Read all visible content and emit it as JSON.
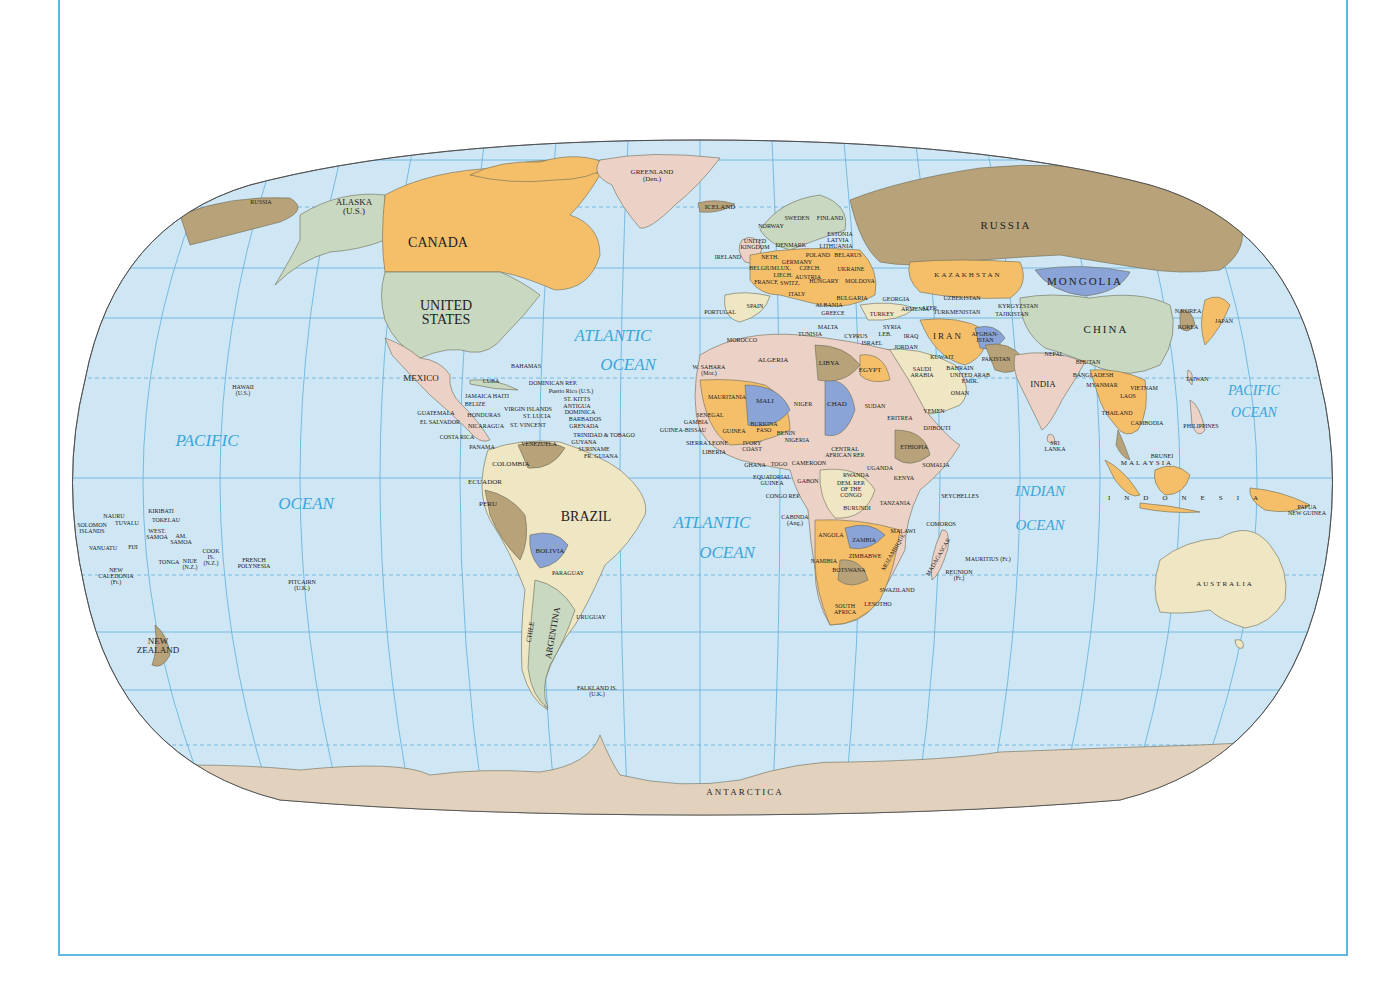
{
  "map": {
    "projection": "Robinson",
    "colors": {
      "ocean": "#cfe6f5",
      "graticule": "#5fb0dc",
      "frame": "#5fb8e3",
      "orange": "#f5bf6a",
      "tan": "#b7a27a",
      "green": "#c9d8c0",
      "pink": "#ecd2c6",
      "blue": "#8aa4d8",
      "cream": "#efe6c4",
      "antarctica": "#e2d2bd",
      "label": "#222222",
      "ocean_label": "#3aa6d8"
    }
  },
  "oceans": [
    {
      "id": "pacific-west-1",
      "text": "PACIFIC",
      "x": 207,
      "y": 441
    },
    {
      "id": "pacific-west-2",
      "text": "OCEAN",
      "x": 306,
      "y": 504
    },
    {
      "id": "atlantic-north-1",
      "text": "ATLANTIC",
      "x": 613,
      "y": 336
    },
    {
      "id": "atlantic-north-2",
      "text": "OCEAN",
      "x": 628,
      "y": 365
    },
    {
      "id": "atlantic-south-1",
      "text": "ATLANTIC",
      "x": 712,
      "y": 523
    },
    {
      "id": "atlantic-south-2",
      "text": "OCEAN",
      "x": 727,
      "y": 553
    },
    {
      "id": "indian-1",
      "text": "INDIAN",
      "x": 1040,
      "y": 491
    },
    {
      "id": "indian-2",
      "text": "OCEAN",
      "x": 1040,
      "y": 525
    },
    {
      "id": "pacific-east-1",
      "text": "PACIFIC",
      "x": 1254,
      "y": 391
    },
    {
      "id": "pacific-east-2",
      "text": "OCEAN",
      "x": 1254,
      "y": 413
    }
  ],
  "countries": [
    {
      "text": "RUSSIA",
      "x": 261,
      "y": 202,
      "size": "xs"
    },
    {
      "text": "ALASKA\n(U.S.)",
      "x": 354,
      "y": 207,
      "size": "m"
    },
    {
      "text": "CANADA",
      "x": 438,
      "y": 243,
      "size": "xl"
    },
    {
      "text": "UNITED\nSTATES",
      "x": 446,
      "y": 313,
      "size": "xl"
    },
    {
      "text": "GREENLAND\n(Den.)",
      "x": 652,
      "y": 176,
      "size": "s"
    },
    {
      "text": "ICELAND",
      "x": 720,
      "y": 207,
      "size": "s"
    },
    {
      "text": "MEXICO",
      "x": 421,
      "y": 378,
      "size": "m"
    },
    {
      "text": "BAHAMAS",
      "x": 526,
      "y": 366,
      "size": "xs"
    },
    {
      "text": "CUBA",
      "x": 491,
      "y": 381,
      "size": "xs"
    },
    {
      "text": "DOMINICAN REP.",
      "x": 553,
      "y": 383,
      "size": "xs"
    },
    {
      "text": "Puerto Rico (U.S.)",
      "x": 571,
      "y": 391,
      "size": "xs"
    },
    {
      "text": "JAMAICA HAITI",
      "x": 487,
      "y": 396,
      "size": "xs"
    },
    {
      "text": "ST. KITTS",
      "x": 577,
      "y": 399,
      "size": "xs"
    },
    {
      "text": "BELIZE",
      "x": 475,
      "y": 404,
      "size": "xs"
    },
    {
      "text": "ANTIGUA",
      "x": 577,
      "y": 406,
      "size": "xs"
    },
    {
      "text": "VIRGIN ISLANDS",
      "x": 528,
      "y": 409,
      "size": "xs"
    },
    {
      "text": "DOMINICA",
      "x": 580,
      "y": 412,
      "size": "xs"
    },
    {
      "text": "GUATEMALA",
      "x": 436,
      "y": 413,
      "size": "xs"
    },
    {
      "text": "HONDURAS",
      "x": 484,
      "y": 415,
      "size": "xs"
    },
    {
      "text": "ST. LUCIA",
      "x": 537,
      "y": 416,
      "size": "xs"
    },
    {
      "text": "BARBADOS",
      "x": 585,
      "y": 419,
      "size": "xs"
    },
    {
      "text": "EL SALVADOR",
      "x": 440,
      "y": 422,
      "size": "xs"
    },
    {
      "text": "NICARAGUA",
      "x": 486,
      "y": 426,
      "size": "xs"
    },
    {
      "text": "ST. VINCENT",
      "x": 528,
      "y": 425,
      "size": "xs"
    },
    {
      "text": "GRENADA",
      "x": 584,
      "y": 426,
      "size": "xs"
    },
    {
      "text": "COSTA RICA",
      "x": 457,
      "y": 437,
      "size": "xs"
    },
    {
      "text": "TRINIDAD & TOBAGO",
      "x": 604,
      "y": 435,
      "size": "xs"
    },
    {
      "text": "GUYANA",
      "x": 584,
      "y": 442,
      "size": "xs"
    },
    {
      "text": "VENEZUELA",
      "x": 539,
      "y": 444,
      "size": "xs"
    },
    {
      "text": "PANAMA",
      "x": 482,
      "y": 447,
      "size": "xs"
    },
    {
      "text": "SURINAME",
      "x": 594,
      "y": 449,
      "size": "xs"
    },
    {
      "text": "FR. GUIANA",
      "x": 601,
      "y": 456,
      "size": "xs"
    },
    {
      "text": "COLOMBIA",
      "x": 511,
      "y": 464,
      "size": "s"
    },
    {
      "text": "ECUADOR",
      "x": 485,
      "y": 482,
      "size": "s"
    },
    {
      "text": "PERU",
      "x": 488,
      "y": 504,
      "size": "s"
    },
    {
      "text": "BRAZIL",
      "x": 586,
      "y": 517,
      "size": "xl"
    },
    {
      "text": "BOLIVIA",
      "x": 550,
      "y": 551,
      "size": "s"
    },
    {
      "text": "PARAGUAY",
      "x": 568,
      "y": 573,
      "size": "xs"
    },
    {
      "text": "CHILE",
      "x": 531,
      "y": 632,
      "size": "s",
      "rotate": -80
    },
    {
      "text": "ARGENTINA",
      "x": 553,
      "y": 633,
      "size": "m",
      "rotate": -80
    },
    {
      "text": "URUGUAY",
      "x": 591,
      "y": 617,
      "size": "xs"
    },
    {
      "text": "FALKLAND IS.\n(U.K.)",
      "x": 597,
      "y": 691,
      "size": "xs"
    },
    {
      "text": "HAWAII\n(U.S.)",
      "x": 243,
      "y": 390,
      "size": "xs"
    },
    {
      "text": "KIRIBATI",
      "x": 161,
      "y": 511,
      "size": "xs"
    },
    {
      "text": "NAURU",
      "x": 114,
      "y": 516,
      "size": "xs"
    },
    {
      "text": "TOKELAU",
      "x": 166,
      "y": 520,
      "size": "xs"
    },
    {
      "text": "SOLOMON\nISLANDS",
      "x": 92,
      "y": 528,
      "size": "xs"
    },
    {
      "text": "TUVALU",
      "x": 127,
      "y": 523,
      "size": "xs"
    },
    {
      "text": "WEST.\nSAMOA",
      "x": 157,
      "y": 534,
      "size": "xs"
    },
    {
      "text": "AM.\nSAMOA",
      "x": 181,
      "y": 539,
      "size": "xs"
    },
    {
      "text": "VANUATU",
      "x": 103,
      "y": 548,
      "size": "xs"
    },
    {
      "text": "FIJI",
      "x": 133,
      "y": 547,
      "size": "xs"
    },
    {
      "text": "COOK\nIS.\n(N.Z.)",
      "x": 211,
      "y": 557,
      "size": "xs"
    },
    {
      "text": "TONGA",
      "x": 169,
      "y": 562,
      "size": "xs"
    },
    {
      "text": "NIUE\n(N.Z.)",
      "x": 190,
      "y": 564,
      "size": "xs"
    },
    {
      "text": "FRENCH\nPOLYNESIA",
      "x": 254,
      "y": 563,
      "size": "xs"
    },
    {
      "text": "NEW\nCALEDONIA\n(Fr.)",
      "x": 116,
      "y": 576,
      "size": "xs"
    },
    {
      "text": "PITCAIRN\n(U.K.)",
      "x": 302,
      "y": 585,
      "size": "xs"
    },
    {
      "text": "NEW\nZEALAND",
      "x": 158,
      "y": 646,
      "size": "m"
    },
    {
      "text": "NORWAY",
      "x": 771,
      "y": 226,
      "size": "xs"
    },
    {
      "text": "SWEDEN",
      "x": 797,
      "y": 218,
      "size": "xs"
    },
    {
      "text": "FINLAND",
      "x": 830,
      "y": 218,
      "size": "xs"
    },
    {
      "text": "ESTONIA",
      "x": 840,
      "y": 234,
      "size": "xs"
    },
    {
      "text": "LATVIA",
      "x": 838,
      "y": 240,
      "size": "xs"
    },
    {
      "text": "LITHUANIA",
      "x": 836,
      "y": 246,
      "size": "xs"
    },
    {
      "text": "UNITED\nKINGDOM",
      "x": 755,
      "y": 244,
      "size": "xs"
    },
    {
      "text": "DENMARK",
      "x": 791,
      "y": 245,
      "size": "xs"
    },
    {
      "text": "IRELAND",
      "x": 728,
      "y": 257,
      "size": "xs"
    },
    {
      "text": "NETH.",
      "x": 770,
      "y": 257,
      "size": "xs"
    },
    {
      "text": "POLAND",
      "x": 818,
      "y": 255,
      "size": "xs"
    },
    {
      "text": "BELARUS",
      "x": 848,
      "y": 255,
      "size": "xs"
    },
    {
      "text": "GERMANY",
      "x": 797,
      "y": 262,
      "size": "xs"
    },
    {
      "text": "BELGIUM",
      "x": 763,
      "y": 268,
      "size": "xs"
    },
    {
      "text": "LUX.",
      "x": 784,
      "y": 268,
      "size": "xs"
    },
    {
      "text": "CZECH.",
      "x": 810,
      "y": 268,
      "size": "xs"
    },
    {
      "text": "UKRAINE",
      "x": 851,
      "y": 269,
      "size": "xs"
    },
    {
      "text": "LIECH.",
      "x": 783,
      "y": 275,
      "size": "xs"
    },
    {
      "text": "AUSTRIA",
      "x": 808,
      "y": 277,
      "size": "xs"
    },
    {
      "text": "HUNGARY",
      "x": 824,
      "y": 281,
      "size": "xs"
    },
    {
      "text": "MOLDOVA",
      "x": 860,
      "y": 281,
      "size": "xs"
    },
    {
      "text": "FRANCE",
      "x": 766,
      "y": 282,
      "size": "xs"
    },
    {
      "text": "SWITZ.",
      "x": 790,
      "y": 283,
      "size": "xs"
    },
    {
      "text": "ITALY",
      "x": 797,
      "y": 294,
      "size": "xs"
    },
    {
      "text": "BULGARIA",
      "x": 852,
      "y": 298,
      "size": "xs"
    },
    {
      "text": "GEORGIA",
      "x": 896,
      "y": 299,
      "size": "xs"
    },
    {
      "text": "SPAIN",
      "x": 755,
      "y": 306,
      "size": "xs"
    },
    {
      "text": "ALBANIA",
      "x": 829,
      "y": 305,
      "size": "xs"
    },
    {
      "text": "ARMENIA",
      "x": 915,
      "y": 309,
      "size": "xs"
    },
    {
      "text": "AZER.",
      "x": 930,
      "y": 308,
      "size": "xs"
    },
    {
      "text": "PORTUGAL",
      "x": 720,
      "y": 312,
      "size": "xs"
    },
    {
      "text": "GREECE",
      "x": 833,
      "y": 313,
      "size": "xs"
    },
    {
      "text": "TURKEY",
      "x": 882,
      "y": 314,
      "size": "xs"
    },
    {
      "text": "MALTA",
      "x": 828,
      "y": 327,
      "size": "xs"
    },
    {
      "text": "TUNISIA",
      "x": 810,
      "y": 334,
      "size": "xs"
    },
    {
      "text": "SYRIA",
      "x": 892,
      "y": 327,
      "size": "xs"
    },
    {
      "text": "CYPRUS",
      "x": 856,
      "y": 336,
      "size": "xs"
    },
    {
      "text": "LEB.",
      "x": 885,
      "y": 334,
      "size": "xs"
    },
    {
      "text": "IRAQ",
      "x": 911,
      "y": 336,
      "size": "xs"
    },
    {
      "text": "ISRAEL",
      "x": 872,
      "y": 343,
      "size": "xs"
    },
    {
      "text": "JORDAN",
      "x": 906,
      "y": 347,
      "size": "xs"
    },
    {
      "text": "MOROCCO",
      "x": 742,
      "y": 340,
      "size": "xs"
    },
    {
      "text": "RUSSIA",
      "x": 1006,
      "y": 225,
      "size": "l",
      "sp": true
    },
    {
      "text": "KAZAKHSTAN",
      "x": 968,
      "y": 275,
      "size": "s",
      "sp": true
    },
    {
      "text": "MONGOLIA",
      "x": 1085,
      "y": 281,
      "size": "l",
      "sp": true
    },
    {
      "text": "UZBEKISTAN",
      "x": 962,
      "y": 298,
      "size": "xs"
    },
    {
      "text": "KYRGYZSTAN",
      "x": 1018,
      "y": 306,
      "size": "xs"
    },
    {
      "text": "TURKMENISTAN",
      "x": 957,
      "y": 312,
      "size": "xs"
    },
    {
      "text": "TAJIKISTAN",
      "x": 1012,
      "y": 314,
      "size": "xs"
    },
    {
      "text": "IRAN",
      "x": 948,
      "y": 336,
      "size": "m",
      "sp": true
    },
    {
      "text": "AFGHAN-\nISTAN",
      "x": 985,
      "y": 337,
      "size": "xs"
    },
    {
      "text": "CHINA",
      "x": 1106,
      "y": 329,
      "size": "l",
      "sp": true
    },
    {
      "text": "N.KOREA",
      "x": 1188,
      "y": 311,
      "size": "xs"
    },
    {
      "text": "KOREA",
      "x": 1188,
      "y": 327,
      "size": "xs"
    },
    {
      "text": "JAPAN",
      "x": 1224,
      "y": 321,
      "size": "xs"
    },
    {
      "text": "KUWAIT",
      "x": 942,
      "y": 357,
      "size": "xs"
    },
    {
      "text": "PAKISTAN",
      "x": 996,
      "y": 359,
      "size": "xs"
    },
    {
      "text": "NEPAL",
      "x": 1054,
      "y": 354,
      "size": "xs"
    },
    {
      "text": "BHUTAN",
      "x": 1088,
      "y": 362,
      "size": "xs"
    },
    {
      "text": "BAHRAIN",
      "x": 960,
      "y": 368,
      "size": "xs"
    },
    {
      "text": "UNITED ARAB\nEMIR.",
      "x": 970,
      "y": 378,
      "size": "xs"
    },
    {
      "text": "SAUDI\nARABIA",
      "x": 922,
      "y": 372,
      "size": "xs"
    },
    {
      "text": "BANGLADESH",
      "x": 1093,
      "y": 375,
      "size": "xs"
    },
    {
      "text": "INDIA",
      "x": 1043,
      "y": 384,
      "size": "m"
    },
    {
      "text": "OMAN",
      "x": 960,
      "y": 393,
      "size": "xs"
    },
    {
      "text": "MYANMAR",
      "x": 1102,
      "y": 385,
      "size": "xs"
    },
    {
      "text": "VIETNAM",
      "x": 1144,
      "y": 388,
      "size": "xs"
    },
    {
      "text": "TAIWAN",
      "x": 1197,
      "y": 379,
      "size": "xs"
    },
    {
      "text": "LAOS",
      "x": 1128,
      "y": 396,
      "size": "xs"
    },
    {
      "text": "THAILAND",
      "x": 1117,
      "y": 413,
      "size": "xs"
    },
    {
      "text": "CAMBODIA",
      "x": 1147,
      "y": 423,
      "size": "xs"
    },
    {
      "text": "PHILIPPINES",
      "x": 1201,
      "y": 426,
      "size": "xs"
    },
    {
      "text": "YEMEN",
      "x": 934,
      "y": 411,
      "size": "xs"
    },
    {
      "text": "SRI\nLANKA",
      "x": 1055,
      "y": 446,
      "size": "xs"
    },
    {
      "text": "BRUNEI",
      "x": 1162,
      "y": 456,
      "size": "xs"
    },
    {
      "text": "MALAYSIA",
      "x": 1147,
      "y": 463,
      "size": "s",
      "sp": true
    },
    {
      "text": "INDONESIA",
      "x": 1190,
      "y": 498,
      "size": "s",
      "wide": true
    },
    {
      "text": "PAPUA\nNEW GUINEA",
      "x": 1307,
      "y": 510,
      "size": "xs"
    },
    {
      "text": "AUSTRALIA",
      "x": 1225,
      "y": 584,
      "size": "s",
      "sp": true
    },
    {
      "text": "W. SAHARA\n(Mor.)",
      "x": 709,
      "y": 370,
      "size": "xs"
    },
    {
      "text": "ALGERIA",
      "x": 773,
      "y": 360,
      "size": "s"
    },
    {
      "text": "LIBYA",
      "x": 829,
      "y": 363,
      "size": "s"
    },
    {
      "text": "EGYPT",
      "x": 870,
      "y": 370,
      "size": "s"
    },
    {
      "text": "MAURITANIA",
      "x": 727,
      "y": 397,
      "size": "xs"
    },
    {
      "text": "MALI",
      "x": 765,
      "y": 401,
      "size": "s"
    },
    {
      "text": "NIGER",
      "x": 803,
      "y": 404,
      "size": "xs"
    },
    {
      "text": "CHAD",
      "x": 837,
      "y": 404,
      "size": "s"
    },
    {
      "text": "SUDAN",
      "x": 875,
      "y": 406,
      "size": "xs"
    },
    {
      "text": "ERITREA",
      "x": 900,
      "y": 418,
      "size": "xs"
    },
    {
      "text": "DJIBOUTI",
      "x": 937,
      "y": 428,
      "size": "xs"
    },
    {
      "text": "SENEGAL",
      "x": 710,
      "y": 415,
      "size": "xs"
    },
    {
      "text": "GAMBIA",
      "x": 696,
      "y": 422,
      "size": "xs"
    },
    {
      "text": "GUINEA-BISSAU",
      "x": 683,
      "y": 430,
      "size": "xs"
    },
    {
      "text": "GUINEA",
      "x": 734,
      "y": 431,
      "size": "xs"
    },
    {
      "text": "BURKINA\nFASO",
      "x": 764,
      "y": 427,
      "size": "xs"
    },
    {
      "text": "BENIN",
      "x": 786,
      "y": 433,
      "size": "xs"
    },
    {
      "text": "NIGERIA",
      "x": 797,
      "y": 440,
      "size": "xs"
    },
    {
      "text": "SIERRA LEONE",
      "x": 707,
      "y": 443,
      "size": "xs"
    },
    {
      "text": "IVORY\nCOAST",
      "x": 752,
      "y": 446,
      "size": "xs"
    },
    {
      "text": "ETHIOPIA",
      "x": 914,
      "y": 447,
      "size": "xs"
    },
    {
      "text": "LIBERIA",
      "x": 714,
      "y": 452,
      "size": "xs"
    },
    {
      "text": "CENTRAL\nAFRICAN REP.",
      "x": 845,
      "y": 452,
      "size": "xs"
    },
    {
      "text": "GHANA",
      "x": 755,
      "y": 465,
      "size": "xs"
    },
    {
      "text": "TOGO",
      "x": 779,
      "y": 464,
      "size": "xs"
    },
    {
      "text": "CAMEROON",
      "x": 809,
      "y": 463,
      "size": "xs"
    },
    {
      "text": "SOMALIA",
      "x": 936,
      "y": 465,
      "size": "xs"
    },
    {
      "text": "UGANDA",
      "x": 880,
      "y": 468,
      "size": "xs"
    },
    {
      "text": "EQUATORIAL\nGUINEA",
      "x": 772,
      "y": 480,
      "size": "xs"
    },
    {
      "text": "GABON",
      "x": 808,
      "y": 481,
      "size": "xs"
    },
    {
      "text": "RWANDA",
      "x": 856,
      "y": 475,
      "size": "xs"
    },
    {
      "text": "KENYA",
      "x": 904,
      "y": 478,
      "size": "xs"
    },
    {
      "text": "DEM. REP.\nOF THE\nCONGO",
      "x": 851,
      "y": 489,
      "size": "xs"
    },
    {
      "text": "CONGO REP.",
      "x": 783,
      "y": 496,
      "size": "xs"
    },
    {
      "text": "SEYCHELLES",
      "x": 960,
      "y": 496,
      "size": "xs"
    },
    {
      "text": "TANZANIA",
      "x": 895,
      "y": 503,
      "size": "xs"
    },
    {
      "text": "BURUNDI",
      "x": 857,
      "y": 508,
      "size": "xs"
    },
    {
      "text": "CABINDA\n(Ang.)",
      "x": 795,
      "y": 520,
      "size": "xs"
    },
    {
      "text": "COMOROS",
      "x": 941,
      "y": 524,
      "size": "xs"
    },
    {
      "text": "ANGOLA",
      "x": 831,
      "y": 535,
      "size": "xs"
    },
    {
      "text": "ZAMBIA",
      "x": 864,
      "y": 540,
      "size": "xs"
    },
    {
      "text": "MALAWI",
      "x": 903,
      "y": 531,
      "size": "xs"
    },
    {
      "text": "MOZAMBIQUE",
      "x": 893,
      "y": 552,
      "size": "xs",
      "rotate": -60
    },
    {
      "text": "MADAGASCAR",
      "x": 938,
      "y": 557,
      "size": "xs",
      "rotate": -60
    },
    {
      "text": "ZIMBABWE",
      "x": 865,
      "y": 556,
      "size": "xs"
    },
    {
      "text": "MAURITIUS (Fr.)",
      "x": 988,
      "y": 559,
      "size": "xs"
    },
    {
      "text": "NAMIBIA",
      "x": 824,
      "y": 561,
      "size": "xs"
    },
    {
      "text": "BOTSWANA",
      "x": 849,
      "y": 570,
      "size": "xs"
    },
    {
      "text": "REUNION\n(Fr.)",
      "x": 959,
      "y": 575,
      "size": "xs"
    },
    {
      "text": "SWAZILAND",
      "x": 897,
      "y": 590,
      "size": "xs"
    },
    {
      "text": "SOUTH\nAFRICA",
      "x": 845,
      "y": 609,
      "size": "xs"
    },
    {
      "text": "LESOTHO",
      "x": 878,
      "y": 604,
      "size": "xs"
    },
    {
      "text": "ANTARCTICA",
      "x": 745,
      "y": 792,
      "size": "m",
      "sp": true
    }
  ]
}
